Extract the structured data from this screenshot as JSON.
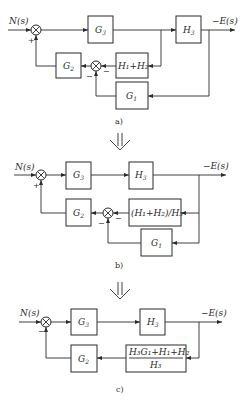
{
  "diagram": {
    "stages": [
      {
        "caption": "a)",
        "input": "N(s)",
        "output": "−E(s)",
        "blocks": {
          "g3": "G",
          "g3_sub": "3",
          "h3": "H",
          "h3_sub": "3",
          "g2": "G",
          "g2_sub": "2",
          "g1": "G",
          "g1_sub": "1",
          "h12": "H₁+H₂"
        },
        "signs": {
          "s1_bottom": "+",
          "s2_right": "−",
          "s2_bottom": "−"
        }
      },
      {
        "caption": "b)",
        "input": "N(s)",
        "output": "−E(s)",
        "blocks": {
          "g3": "G",
          "g3_sub": "3",
          "h3": "H",
          "h3_sub": "3",
          "g2": "G",
          "g2_sub": "2",
          "g1": "G",
          "g1_sub": "1",
          "h12h3": "(H₁+H₂)/H₃"
        },
        "signs": {
          "s1_bottom": "+",
          "s2_right": "−",
          "s2_bottom": "−"
        }
      },
      {
        "caption": "c)",
        "input": "N(s)",
        "output": "−E(s)",
        "blocks": {
          "g3": "G",
          "g3_sub": "3",
          "h3": "H",
          "h3_sub": "3",
          "g2": "G",
          "g2_sub": "2",
          "fb_num": "H₃G₁+H₁+H₂",
          "fb_den": "H₃"
        },
        "signs": {
          "s1_bottom": "−"
        }
      }
    ],
    "transform_arrow": "⇓"
  }
}
